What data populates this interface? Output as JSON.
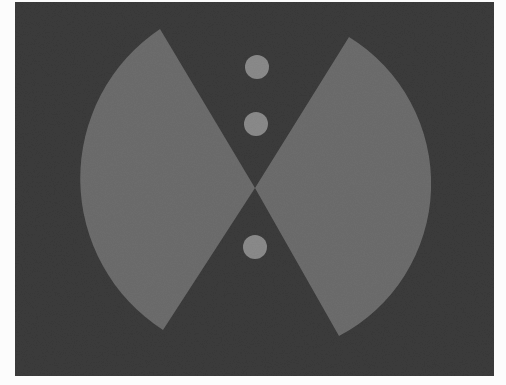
{
  "figure": {
    "colors": {
      "page": "#fcfcfc",
      "background": "#3b3b3b",
      "wedge": "#6d6d6d",
      "dot": "#8b8b8b"
    },
    "frame": {
      "x": 15,
      "y": 2,
      "width": 479,
      "height": 374
    },
    "center": {
      "x": 255,
      "y": 188
    },
    "wedges": [
      {
        "name": "left-wedge",
        "top": [
          160,
          29
        ],
        "bottom": [
          163,
          330
        ],
        "radius": 180
      },
      {
        "name": "right-wedge",
        "top": [
          349,
          37
        ],
        "bottom": [
          339,
          336
        ],
        "radius": 172
      }
    ],
    "dots": [
      {
        "cx": 257,
        "cy": 67,
        "r": 12
      },
      {
        "cx": 256,
        "cy": 124,
        "r": 12
      },
      {
        "cx": 255,
        "cy": 247,
        "r": 12
      }
    ]
  }
}
